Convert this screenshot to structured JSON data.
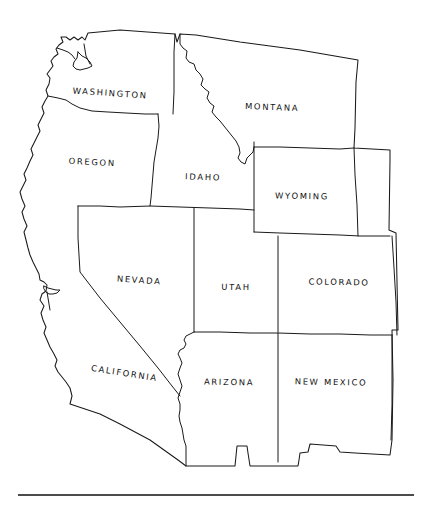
{
  "figure": {
    "background_color": "#ffffff",
    "ink_color": "#1a1a1a",
    "style": "hand-drawn black ink outline map, no fill"
  },
  "map": {
    "region": "Western United States",
    "state_count": 11,
    "labels": [
      {
        "id": "washington",
        "text": "WASHINGTON",
        "x": 110,
        "y": 96,
        "rotate": 4
      },
      {
        "id": "oregon",
        "text": "OREGON",
        "x": 92,
        "y": 165,
        "rotate": 3
      },
      {
        "id": "idaho",
        "text": "IDAHO",
        "x": 203,
        "y": 180,
        "rotate": 2
      },
      {
        "id": "montana",
        "text": "MONTANA",
        "x": 272,
        "y": 110,
        "rotate": 2
      },
      {
        "id": "wyoming",
        "text": "WYOMING",
        "x": 302,
        "y": 199,
        "rotate": 1
      },
      {
        "id": "nevada",
        "text": "NEVADA",
        "x": 139,
        "y": 283,
        "rotate": 4
      },
      {
        "id": "utah",
        "text": "UTAH",
        "x": 236,
        "y": 290,
        "rotate": 1
      },
      {
        "id": "colorado",
        "text": "COLORADO",
        "x": 339,
        "y": 285,
        "rotate": 1
      },
      {
        "id": "california",
        "text": "CALIFORNIA",
        "x": 124,
        "y": 376,
        "rotate": 9
      },
      {
        "id": "arizona",
        "text": "ARIZONA",
        "x": 229,
        "y": 385,
        "rotate": 1
      },
      {
        "id": "new-mexico",
        "text": "NEW MEXICO",
        "x": 331,
        "y": 385,
        "rotate": 1
      }
    ]
  },
  "footer": {
    "rule_y": 495,
    "rule_x_start": 18,
    "rule_x_end": 414
  }
}
